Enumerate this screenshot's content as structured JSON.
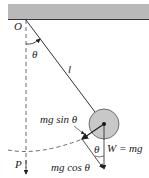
{
  "figure": {
    "labels": {
      "pivot": "O",
      "angle_top": "θ",
      "length": "l",
      "tangential_force": "mg sin θ",
      "angle_bottom": "θ",
      "weight_label": "W = mg",
      "radial_force": "mg cos θ",
      "equilibrium_point": "P"
    },
    "colors": {
      "ceiling": "#b9b9b9",
      "bob": "#c8c8c8",
      "line": "#333333"
    }
  }
}
